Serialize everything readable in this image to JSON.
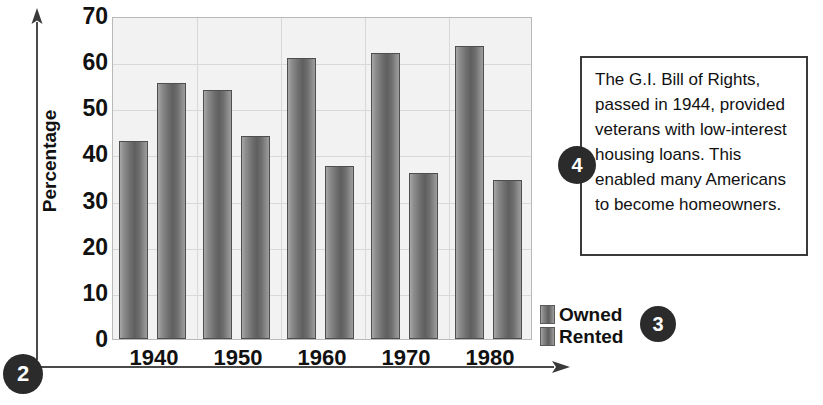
{
  "chart_data": {
    "type": "bar",
    "title": "",
    "xlabel": "",
    "ylabel": "Percentage",
    "categories": [
      "1940",
      "1950",
      "1960",
      "1970",
      "1980"
    ],
    "series": [
      {
        "name": "Owned",
        "values": [
          43,
          54,
          61,
          62,
          63.5
        ]
      },
      {
        "name": "Rented",
        "values": [
          55.5,
          44,
          37.5,
          36,
          34.5
        ]
      }
    ],
    "ylim": [
      0,
      70
    ],
    "yticks": [
      70,
      60,
      50,
      40,
      30,
      20,
      10,
      0
    ],
    "grid": true,
    "legend_position": "right-bottom"
  },
  "axes": {
    "y_title": "Percentage",
    "y_ticks": [
      "70",
      "60",
      "50",
      "40",
      "30",
      "20",
      "10",
      "0"
    ],
    "x_ticks": [
      "1940",
      "1950",
      "1960",
      "1970",
      "1980"
    ]
  },
  "legend": {
    "items": [
      {
        "label": "Owned"
      },
      {
        "label": "Rented"
      }
    ]
  },
  "callouts": {
    "axis_marker": "2",
    "legend_marker": "3",
    "note_marker": "4"
  },
  "note": {
    "text": "The G.I. Bill of Rights, passed in 1944, provided veterans with low-interest housing loans. This enabled many Americans to become homeowners."
  },
  "colors": {
    "bar_dark": "#5f5f5f",
    "bar_light": "#a8a8a8",
    "plot_background": "#f2f2f2",
    "gridline": "#d8d8d8",
    "badge": "#2b2b2b",
    "text": "#111111"
  }
}
